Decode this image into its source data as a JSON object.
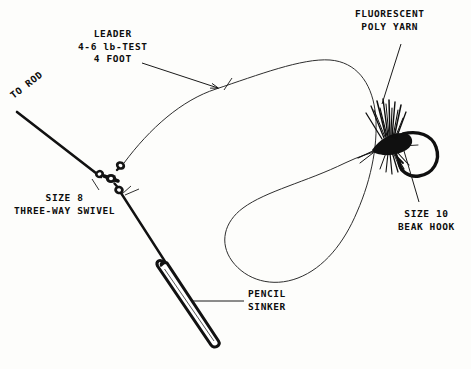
{
  "diagram": {
    "background_color": "#fdfdfb",
    "ink_color": "#0d0d0d",
    "line_color": "#2a2a2a"
  },
  "labels": {
    "to_rod": "TO ROD",
    "leader": "LEADER\n4-6 lb-TEST\n4 FOOT",
    "poly_yarn": "FLUORESCENT\nPOLY YARN",
    "swivel": "SIZE 8\nTHREE-WAY SWIVEL",
    "beak_hook": "SIZE 10\nBEAK HOOK",
    "pencil_sinker": "PENCIL\nSINKER"
  },
  "components": {
    "main_line": "main-line-to-rod",
    "swivel": "three-way-swivel",
    "dropper": "dropper-line",
    "sinker": "pencil-sinker",
    "leader_loop": "monofilament-leader-loop",
    "fly": "yarn-fly",
    "hook": "beak-hook"
  }
}
